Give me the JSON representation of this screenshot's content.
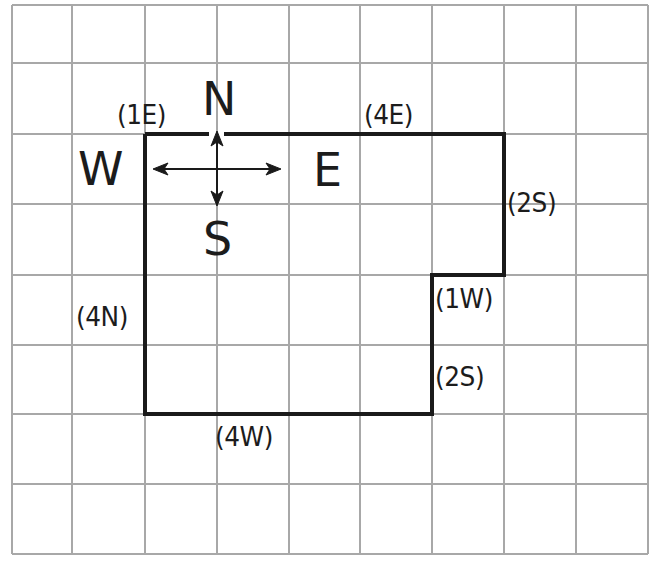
{
  "diagram": {
    "type": "grid-path-with-compass",
    "grid": {
      "columns": 9,
      "rows": 8,
      "x_lines": [
        12,
        72,
        145,
        217,
        289,
        360,
        432,
        504,
        576,
        648
      ],
      "y_lines": [
        5,
        63,
        134,
        204,
        275,
        345,
        414,
        484,
        554
      ],
      "line_color": "#a8a8a8"
    },
    "outline": {
      "color": "#1a1a1a",
      "points": [
        [
          145,
          134
        ],
        [
          504,
          134
        ],
        [
          504,
          275
        ],
        [
          432,
          275
        ],
        [
          432,
          414
        ],
        [
          145,
          414
        ],
        [
          145,
          134
        ]
      ]
    },
    "compass": {
      "north": "N",
      "south": "S",
      "east": "E",
      "west": "W",
      "center": [
        217,
        169
      ]
    },
    "step_labels": {
      "start_east": "(1E)",
      "top_east": "(4E)",
      "right_south": "(2S)",
      "notch_west": "(1W)",
      "lower_south": "(2S)",
      "bottom_west": "(4W)",
      "left_north": "(4N)"
    }
  }
}
